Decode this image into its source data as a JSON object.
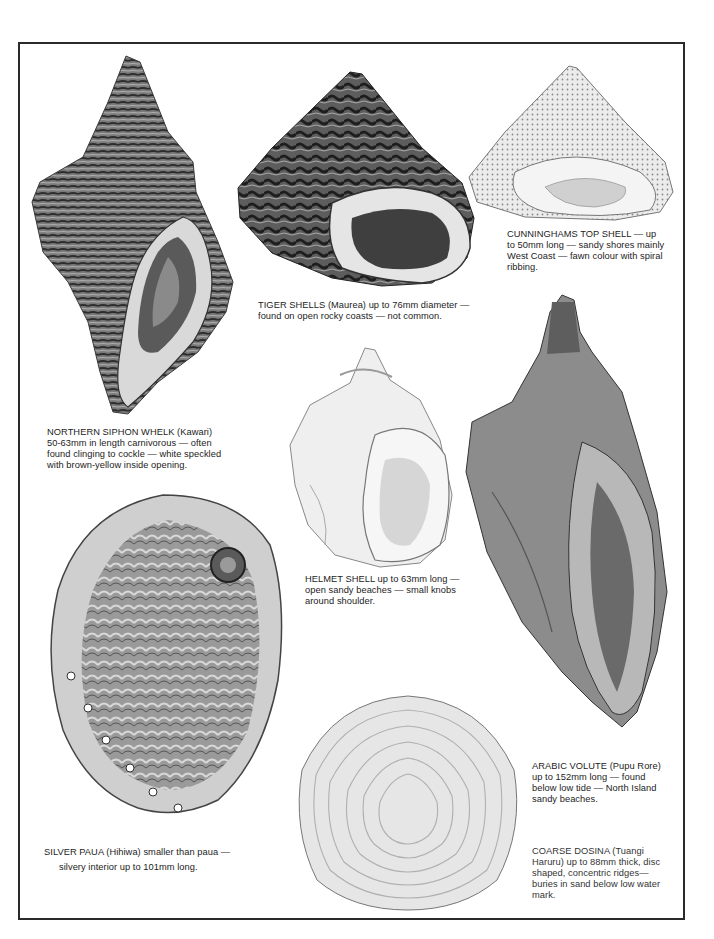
{
  "page": {
    "shells": [
      {
        "id": "northern-siphon-whelk",
        "caption_lines": [
          "NORTHERN SIPHON WHELK (Kawari)",
          "50-63mm in length carnivorous — often",
          "found clinging to cockle — white speckled",
          "with brown-yellow inside opening."
        ]
      },
      {
        "id": "tiger-shells",
        "caption_lines": [
          "TIGER SHELLS (Maurea) up to 76mm diameter —",
          "found on open rocky coasts — not common."
        ]
      },
      {
        "id": "cunninghams-top-shell",
        "caption_lines": [
          "CUNNINGHAMS TOP SHELL — up",
          "to 50mm long — sandy shores mainly",
          "West Coast — fawn colour with spiral",
          "ribbing."
        ]
      },
      {
        "id": "helmet-shell",
        "caption_lines": [
          "HELMET SHELL up to 63mm long —",
          "open sandy beaches — small knobs",
          "around shoulder."
        ]
      },
      {
        "id": "arabic-volute",
        "caption_lines": [
          "ARABIC VOLUTE (Pupu Rore)",
          "up to 152mm long — found",
          "below low tide — North Island",
          "sandy beaches."
        ]
      },
      {
        "id": "silver-paua",
        "caption_lines": [
          "SILVER PAUA (Hihiwa) smaller than paua —",
          "silvery interior up to 101mm long."
        ]
      },
      {
        "id": "coarse-dosina",
        "caption_lines": [
          "COARSE DOSINA (Tuangi",
          "Haruru) up to 88mm thick, disc",
          "shaped, concentric ridges—",
          "buries in sand below low water",
          "mark."
        ]
      }
    ]
  }
}
